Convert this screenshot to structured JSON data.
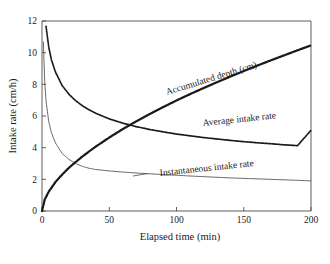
{
  "chart_data": {
    "type": "line",
    "title": "",
    "xlabel": "Elapsed time (min)",
    "ylabel": "Intake rate (cm/h)",
    "xlim": [
      0,
      200
    ],
    "ylim": [
      0,
      12
    ],
    "xticks": [
      0,
      50,
      100,
      150,
      200
    ],
    "yticks": [
      0,
      2,
      4,
      6,
      8,
      10,
      12
    ],
    "xtick_labels": [
      "0",
      "50",
      "100",
      "150",
      "200"
    ],
    "ytick_labels": [
      "0",
      "2",
      "4",
      "6",
      "8",
      "10",
      "12"
    ],
    "grid": false,
    "legend_position": "inline-annotations",
    "series": [
      {
        "name": "Accumulated depth (cm)",
        "style": "dotted-thick",
        "color": "#1a1a1a",
        "annotation": "Accumulated depth (cm)",
        "annotation_rotation": -17,
        "x": [
          0,
          2,
          5,
          10,
          15,
          20,
          25,
          30,
          35,
          40,
          50,
          60,
          70,
          80,
          90,
          100,
          110,
          120,
          130,
          140,
          150,
          160,
          170,
          180,
          190,
          200
        ],
        "y": [
          0,
          0.72,
          1.22,
          1.83,
          2.3,
          2.73,
          3.09,
          3.44,
          3.76,
          4.07,
          4.64,
          5.17,
          5.66,
          6.12,
          6.56,
          6.98,
          7.38,
          7.76,
          8.13,
          8.49,
          8.84,
          9.18,
          9.51,
          9.83,
          10.15,
          10.46
        ]
      },
      {
        "name": "Average intake rate",
        "style": "dotted-medium",
        "color": "#1a1a1a",
        "annotation": "Average intake rate",
        "annotation_rotation": -6,
        "x": [
          3,
          5,
          7,
          10,
          15,
          20,
          25,
          30,
          35,
          40,
          50,
          60,
          70,
          80,
          90,
          100,
          110,
          120,
          130,
          140,
          150,
          160,
          170,
          180,
          190,
          200
        ],
        "y": [
          11.66,
          10.36,
          9.55,
          8.78,
          7.92,
          7.38,
          6.97,
          6.65,
          6.39,
          6.17,
          5.82,
          5.55,
          5.33,
          5.15,
          5.0,
          4.86,
          4.75,
          4.64,
          4.55,
          4.46,
          4.38,
          4.31,
          4.25,
          4.18,
          4.13,
          5.1
        ]
      },
      {
        "name": "Instantaneous intake rate",
        "style": "solid-thin",
        "color": "#4d4d4d",
        "annotation": "Instantaneous intake rate",
        "annotation_rotation": -6,
        "x": [
          1,
          2,
          3,
          5,
          7,
          10,
          15,
          20,
          25,
          30,
          35,
          40,
          50,
          60,
          70,
          80,
          90,
          100,
          110,
          120,
          130,
          140,
          150,
          160,
          170,
          180,
          190,
          200
        ],
        "y": [
          10.7,
          8.2,
          6.95,
          5.65,
          4.95,
          4.3,
          3.63,
          3.26,
          3.0,
          2.82,
          2.7,
          2.62,
          2.53,
          2.46,
          2.4,
          2.35,
          2.3,
          2.26,
          2.21,
          2.17,
          2.13,
          2.09,
          2.06,
          2.03,
          2.0,
          1.97,
          1.94,
          1.9
        ]
      }
    ]
  },
  "axes": {
    "x_title": "Elapsed time (min)",
    "y_title": "Intake rate (cm/h)"
  },
  "annotations": {
    "accumulated_depth": "Accumulated depth (cm)",
    "average_intake_rate": "Average intake rate",
    "instantaneous_intake_rate": "Instantaneous intake rate"
  },
  "colors": {
    "axis": "#4d4d4d",
    "text": "#1a1a1a",
    "accumulated": "#1a1a1a",
    "average": "#1a1a1a",
    "instantaneous": "#4d4d4d",
    "background": "#ffffff"
  }
}
